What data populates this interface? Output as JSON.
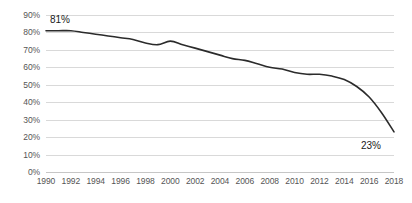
{
  "chart_data": {
    "type": "line",
    "title": "",
    "subtitle": "",
    "xlabel": "",
    "ylabel": "",
    "xlim": [
      1990,
      2018
    ],
    "ylim": [
      0,
      90
    ],
    "grid": true,
    "legend": false,
    "legend_position": "none",
    "line_color": "#2b2b2b",
    "grid_color": "#d9d9d9",
    "tick_label_color": "#555555",
    "x": [
      1990,
      1991,
      1992,
      1993,
      1994,
      1995,
      1996,
      1997,
      1998,
      1999,
      2000,
      2001,
      2002,
      2003,
      2004,
      2005,
      2006,
      2007,
      2008,
      2009,
      2010,
      2011,
      2012,
      2013,
      2014,
      2015,
      2016,
      2017,
      2018
    ],
    "values": [
      81,
      81,
      81,
      80,
      79,
      78,
      77,
      76,
      74,
      73,
      75,
      73,
      71,
      69,
      67,
      65,
      64,
      62,
      60,
      59,
      57,
      56,
      56,
      55,
      53,
      49,
      43,
      34,
      23
    ],
    "categories": [
      "1990",
      "1991",
      "1992",
      "1993",
      "1994",
      "1995",
      "1996",
      "1997",
      "1998",
      "1999",
      "2000",
      "2001",
      "2002",
      "2003",
      "2004",
      "2005",
      "2006",
      "2007",
      "2008",
      "2009",
      "2010",
      "2011",
      "2012",
      "2013",
      "2014",
      "2015",
      "2016",
      "2017",
      "2018"
    ],
    "y_tick_labels": [
      "90%",
      "80%",
      "70%",
      "60%",
      "50%",
      "40%",
      "30%",
      "20%",
      "10%",
      "0%"
    ],
    "y_tick_values": [
      90,
      80,
      70,
      60,
      50,
      40,
      30,
      20,
      10,
      0
    ],
    "x_tick_labels": [
      "1990",
      "1992",
      "1994",
      "1996",
      "1998",
      "2000",
      "2002",
      "2004",
      "2006",
      "2008",
      "2010",
      "2012",
      "2014",
      "2016",
      "2018"
    ],
    "x_tick_values": [
      1990,
      1992,
      1994,
      1996,
      1998,
      2000,
      2002,
      2004,
      2006,
      2008,
      2010,
      2012,
      2014,
      2016,
      2018
    ],
    "annotations": [
      {
        "name": "first-point-label",
        "text": "81%",
        "x": 1990,
        "y": 81
      },
      {
        "name": "last-point-label",
        "text": "23%",
        "x": 2018,
        "y": 23
      }
    ]
  }
}
